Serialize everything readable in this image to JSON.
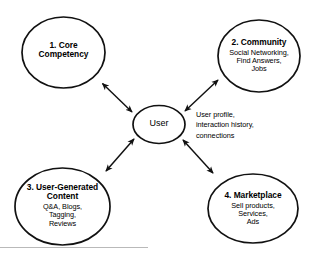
{
  "diagram": {
    "background_color": "#ffffff",
    "stroke_color": "#111111",
    "text_color": "#000000",
    "center": {
      "label": "User",
      "shape": "ellipse"
    },
    "side_note": {
      "line1": "User profile,",
      "line2": "interaction history,",
      "line3": "connections"
    },
    "nodes": [
      {
        "id": "core-competency",
        "title": "1. Core",
        "title_line2": "Competency",
        "subtitle_lines": [],
        "position": "top-left"
      },
      {
        "id": "community",
        "title": "2. Community",
        "title_line2": "",
        "subtitle_lines": [
          "Social Networking,",
          "Find Answers,",
          "Jobs"
        ],
        "position": "top-right"
      },
      {
        "id": "user-generated-content",
        "title": "3. User-Generated",
        "title_line2": "Content",
        "subtitle_lines": [
          "Q&A, Blogs,",
          "Tagging,",
          "Reviews"
        ],
        "position": "bottom-left"
      },
      {
        "id": "marketplace",
        "title": "4. Marketplace",
        "title_line2": "",
        "subtitle_lines": [
          "Sell products,",
          "Services,",
          "Ads"
        ],
        "position": "bottom-right"
      }
    ],
    "connectors": [
      {
        "id": "center-to-core-competency",
        "type": "double-arrow"
      },
      {
        "id": "center-to-community",
        "type": "double-arrow"
      },
      {
        "id": "center-to-user-generated-content",
        "type": "double-arrow"
      },
      {
        "id": "center-to-marketplace",
        "type": "double-arrow"
      }
    ],
    "footer_rule": {
      "visible": true
    }
  }
}
